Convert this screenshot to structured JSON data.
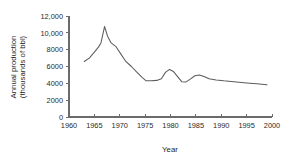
{
  "chart_data": {
    "type": "line",
    "title": "",
    "xlabel": "Year",
    "ylabel": "Annual production (thousands of bbl)",
    "ylabel_line1": "Annual production",
    "ylabel_line2": "(thousands of bbl)",
    "xlim": [
      1960,
      2000
    ],
    "ylim": [
      0,
      12000
    ],
    "xticks": [
      1960,
      1965,
      1970,
      1975,
      1980,
      1985,
      1990,
      1995,
      2000
    ],
    "xtick_labels": [
      "1960",
      "1965",
      "1970",
      "1975",
      "1980",
      "1985",
      "1990",
      "1995",
      "2000"
    ],
    "yticks": [
      0,
      2000,
      4000,
      6000,
      8000,
      10000,
      12000
    ],
    "ytick_labels": [
      "0",
      "2000",
      "4000",
      "6000",
      "8000",
      "10,000",
      "12,000"
    ],
    "grid": false,
    "legend": false,
    "series": [
      {
        "name": "Annual production",
        "x": [
          1963.0,
          1964.0,
          1965.0,
          1965.8,
          1966.3,
          1967.0,
          1967.6,
          1968.3,
          1969.2,
          1970.2,
          1971.2,
          1972.3,
          1973.4,
          1974.4,
          1975.2,
          1976.2,
          1977.3,
          1978.2,
          1979.0,
          1979.8,
          1980.6,
          1981.4,
          1982.2,
          1983.0,
          1983.9,
          1984.8,
          1985.7,
          1986.6,
          1987.6,
          1989.0,
          1990.5,
          1992.5,
          1995.0,
          1997.0,
          1999.0
        ],
        "y": [
          6600,
          7000,
          7700,
          8300,
          8800,
          10750,
          9600,
          8800,
          8400,
          7500,
          6600,
          6000,
          5300,
          4700,
          4300,
          4300,
          4350,
          4550,
          5300,
          5650,
          5400,
          4800,
          4200,
          4150,
          4500,
          4900,
          5000,
          4800,
          4550,
          4400,
          4300,
          4200,
          4050,
          3950,
          3820
        ]
      }
    ]
  },
  "axis": {
    "x_title": "Year",
    "y_title_line1": "Annual production",
    "y_title_line2": "(thousands of bbl)"
  },
  "colors": {
    "line": "#5c5c5c",
    "axis": "#6b6b6b",
    "text": "#2b2b2b",
    "background": "#ffffff"
  }
}
